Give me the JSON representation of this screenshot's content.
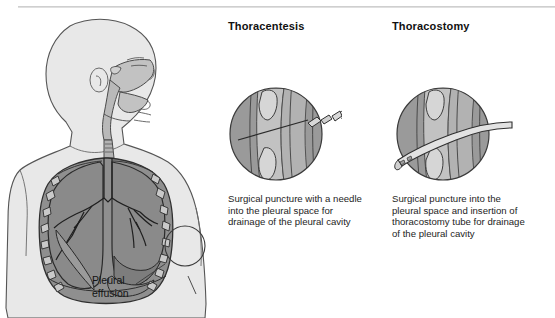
{
  "figure": {
    "type": "medical-illustration",
    "colors": {
      "page_background": "#ffffff",
      "body_silhouette": "#e8e8e8",
      "lung_fill": "#909090",
      "pleural_fluid": "#8a8a8a",
      "rib_light": "#c9c9c9",
      "inset_skin": "#9a9a9a",
      "inset_tissue": "#c2c2c2",
      "outline": "#3a3a3a",
      "text": "#1a1a1a"
    }
  },
  "anatomy": {
    "name": "anterior-thorax-with-head-profile",
    "effusion_label": "Pleural\neffusion",
    "callout_circle": {
      "cx": 185,
      "cy": 238,
      "r": 20
    }
  },
  "panels": [
    {
      "id": "thoracentesis",
      "heading": "Thoracentesis",
      "caption": "Surgical puncture with a needle\ninto the pleural space for\ndrainage of the pleural cavity",
      "inset": {
        "name": "needle-insertion-detail",
        "instrument": "needle-with-syringe-hub"
      }
    },
    {
      "id": "thoracostomy",
      "heading": "Thoracostomy",
      "caption": "Surgical puncture into the\npleural space and insertion of\nthoracostomy tube for drainage\nof the pleural cavity",
      "inset": {
        "name": "chest-tube-insertion-detail",
        "instrument": "thoracostomy-tube"
      }
    }
  ]
}
